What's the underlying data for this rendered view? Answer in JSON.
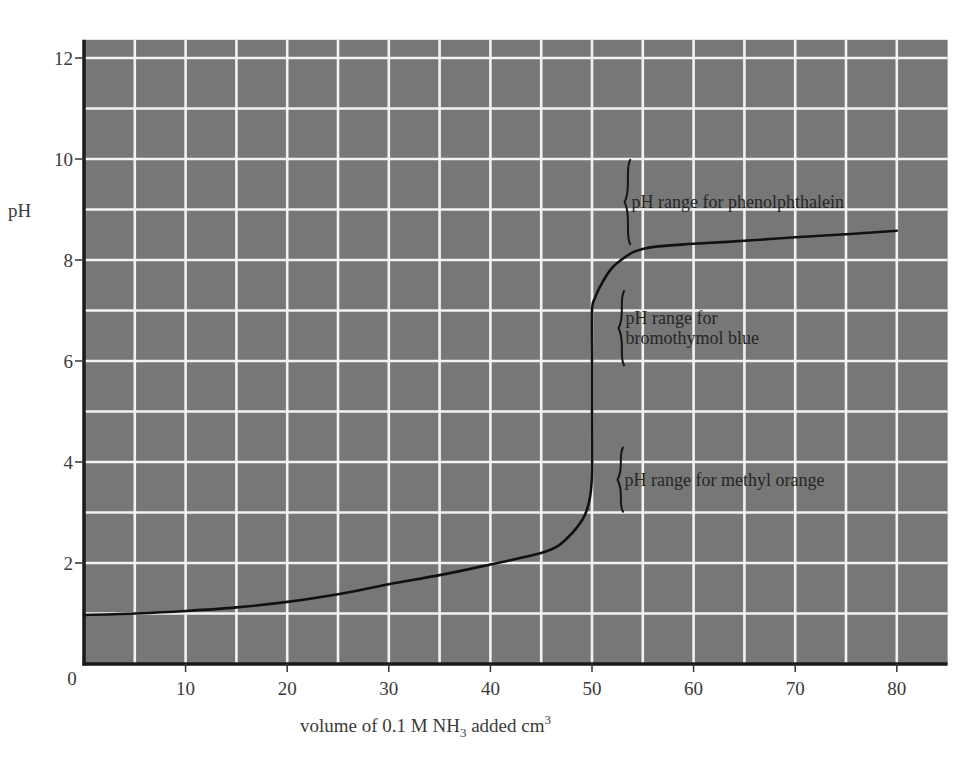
{
  "chart_data": {
    "type": "line",
    "title": "",
    "xlabel": "volume of 0.1 M NH₃ added  cm³",
    "xlabel_parts": {
      "main": "volume of 0.1 M NH",
      "subscript": "3",
      "after_sub": " added  cm",
      "superscript": "3"
    },
    "ylabel": "pH",
    "xlim": [
      0,
      85
    ],
    "ylim": [
      0,
      12.36
    ],
    "x_ticks": [
      0,
      10,
      20,
      30,
      40,
      50,
      60,
      70,
      80
    ],
    "x_tick_labels": [
      "0",
      "10",
      "20",
      "30",
      "40",
      "50",
      "60",
      "70",
      "80"
    ],
    "y_ticks": [
      2,
      4,
      6,
      8,
      10,
      12
    ],
    "y_tick_labels": [
      "2",
      "4",
      "6",
      "8",
      "10",
      "12"
    ],
    "grid": {
      "on": true,
      "x_step": 5,
      "y_step": 1,
      "background_color": "#777777",
      "line_color": "#f2f2f2"
    },
    "series": [
      {
        "name": "titration curve",
        "color": "#111111",
        "points": [
          [
            0,
            0.97
          ],
          [
            5,
            1.0
          ],
          [
            10,
            1.05
          ],
          [
            15,
            1.12
          ],
          [
            20,
            1.23
          ],
          [
            25,
            1.38
          ],
          [
            30,
            1.58
          ],
          [
            35,
            1.76
          ],
          [
            40,
            1.97
          ],
          [
            42.5,
            2.08
          ],
          [
            45,
            2.2
          ],
          [
            46.5,
            2.32
          ],
          [
            47.5,
            2.48
          ],
          [
            48.5,
            2.7
          ],
          [
            49.3,
            2.95
          ],
          [
            49.8,
            3.3
          ],
          [
            50,
            3.8
          ],
          [
            50,
            5.0
          ],
          [
            50,
            6.0
          ],
          [
            50,
            7.0
          ],
          [
            50.3,
            7.25
          ],
          [
            51,
            7.55
          ],
          [
            52,
            7.85
          ],
          [
            53,
            8.02
          ],
          [
            54,
            8.15
          ],
          [
            55,
            8.22
          ],
          [
            56.5,
            8.27
          ],
          [
            60,
            8.32
          ],
          [
            65,
            8.38
          ],
          [
            70,
            8.45
          ],
          [
            75,
            8.51
          ],
          [
            80,
            8.58
          ]
        ]
      }
    ],
    "annotations": [
      {
        "name": "phenolphthalein",
        "lines": [
          "pH range for phenolphthalein"
        ],
        "ph_range": [
          8.3,
          10.0
        ],
        "brace_x": 53.7
      },
      {
        "name": "bromothymol-blue",
        "lines": [
          "pH range for",
          "bromothymol blue"
        ],
        "ph_range": [
          5.9,
          7.4
        ],
        "brace_x": 53.1
      },
      {
        "name": "methyl-orange",
        "lines": [
          "pH range for methyl orange"
        ],
        "ph_range": [
          3.0,
          4.3
        ],
        "brace_x": 53.0
      }
    ]
  }
}
